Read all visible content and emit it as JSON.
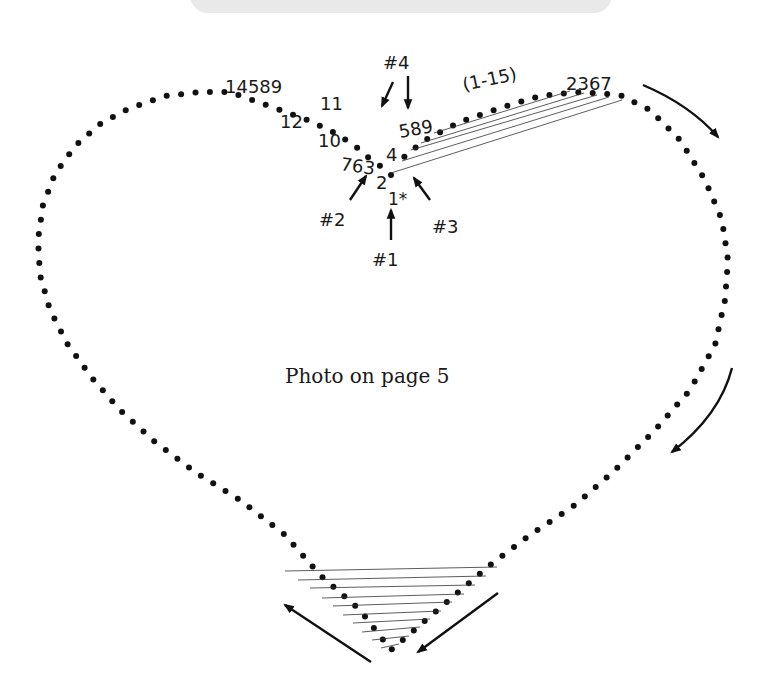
{
  "caption": "Photo on page 5",
  "labels": {
    "start_markers": {
      "m1": "#1",
      "m2": "#2",
      "m3": "#3",
      "m4": "#4"
    },
    "start_point": "1*",
    "range_note": "(1-15)",
    "left_sequence_top": "14589",
    "left_11": "11",
    "left_12": "12",
    "left_10": "10",
    "left_763": "763",
    "left_2": "2",
    "right_4": "4",
    "right_589": "589",
    "right_top": "2367"
  },
  "colors": {
    "ink": "#111111",
    "banner": "#e9e9e9",
    "string": "#333333"
  }
}
